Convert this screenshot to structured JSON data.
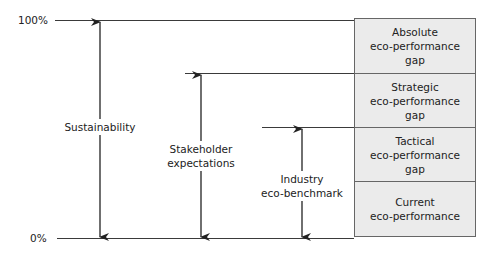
{
  "axis": {
    "top_label": "100%",
    "bottom_label": "0%"
  },
  "arrows": [
    {
      "id": "sustainability",
      "lines": [
        "Sustainability"
      ]
    },
    {
      "id": "stakeholder",
      "lines": [
        "Stakeholder",
        "expectations"
      ]
    },
    {
      "id": "industry",
      "lines": [
        "Industry",
        "eco-benchmark"
      ]
    }
  ],
  "stack": {
    "cells": [
      {
        "lines": [
          "Absolute",
          "eco-performance",
          "gap"
        ]
      },
      {
        "lines": [
          "Strategic",
          "eco-performance",
          "gap"
        ]
      },
      {
        "lines": [
          "Tactical",
          "eco-performance",
          "gap"
        ]
      },
      {
        "lines": [
          "Current",
          "eco-performance"
        ]
      }
    ]
  },
  "colors": {
    "stack_fill": "#ebebeb",
    "line": "#3a3a3a",
    "text": "#222222"
  }
}
